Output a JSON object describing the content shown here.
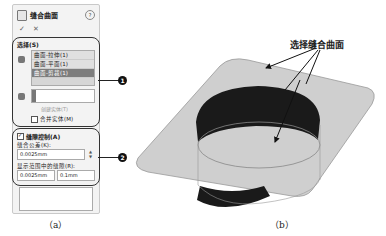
{
  "panel": {
    "title": "缝合曲面",
    "help_icon": "?",
    "ok_label": "✓",
    "cancel_label": "✕",
    "selection_group": {
      "label": "选择(S)",
      "list_items": [
        "曲面-拉伸(1)",
        "曲面-平面(1)",
        "曲面-剪裁(1)"
      ],
      "selected_index": 2,
      "body_input_value": "",
      "create_solid_label": "创建实体(T)",
      "merge_entities_label": "合并实体(M)",
      "merge_checked": false
    },
    "gap_control": {
      "label": "缝隙控制(A)",
      "checked": true,
      "tolerance_label": "缝合公差(K):",
      "tolerance_value": "0.0025mm",
      "range_label": "显示范围中的缝隙(R):",
      "range_min": "0.0025mm",
      "range_max": "0.1mm"
    }
  },
  "callouts": [
    "1",
    "2"
  ],
  "annotation": "选择缝合曲面",
  "captions": {
    "a": "（a）",
    "b": "（b）"
  }
}
